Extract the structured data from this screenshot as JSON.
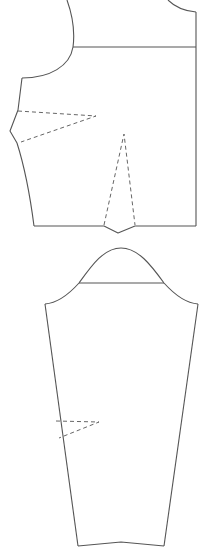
{
  "diagram": {
    "type": "sewing-pattern",
    "pieces": [
      {
        "name": "bodice",
        "features": [
          "armhole",
          "shoulder-line",
          "neckline",
          "bust-dart",
          "waist-dart"
        ]
      },
      {
        "name": "sleeve",
        "features": [
          "sleeve-cap",
          "biceps-line",
          "elbow-dart",
          "hem"
        ]
      }
    ],
    "colors": {
      "line": "#555555",
      "dash": "#666666",
      "background": "#ffffff"
    },
    "labels": []
  }
}
